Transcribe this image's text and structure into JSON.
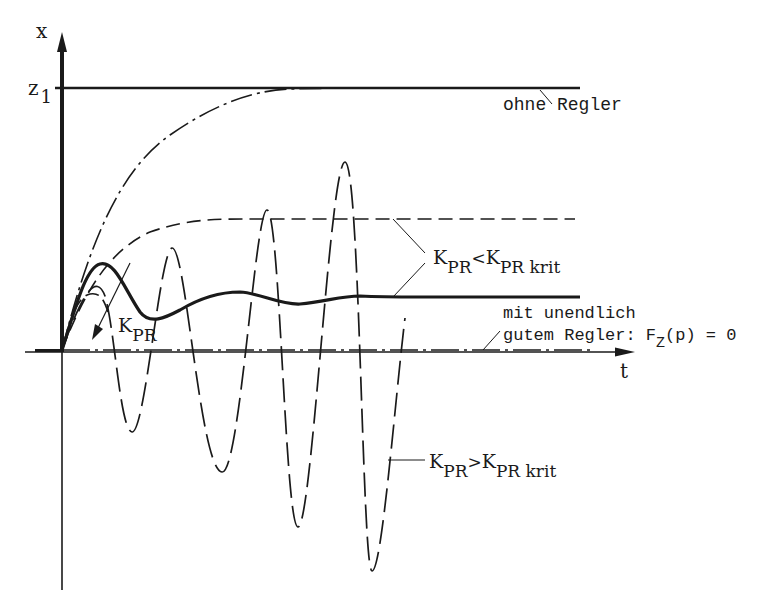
{
  "diagram": {
    "type": "step-response-comparison",
    "axes": {
      "y_label": "x",
      "x_label": "t",
      "y_tick_label_main": "z",
      "y_tick_label_sub": "1"
    },
    "labels": {
      "ohne_regler": "ohne Regler",
      "kpr_less": {
        "k1": "K",
        "k1_sub": "PR",
        "op": "<",
        "k2": "K",
        "k2_sub": "PR krit"
      },
      "kpr_greater": {
        "k1": "K",
        "k1_sub": "PR",
        "op": ">",
        "k2": "K",
        "k2_sub": "PR krit"
      },
      "kpr_arrow": {
        "k": "K",
        "k_sub": "PR"
      },
      "ideal_line1": "mit unendlich",
      "ideal_line2_prefix": "gutem Regler: F",
      "ideal_line2_sub": "Z",
      "ideal_line2_suffix": "(p) = 0"
    },
    "curves": [
      {
        "name": "ohne Regler",
        "style": "dash-dot",
        "behavior": "first-order rise to z1"
      },
      {
        "name": "K_PR < K_PR krit (weak)",
        "style": "dashed",
        "behavior": "rise to intermediate level"
      },
      {
        "name": "K_PR < K_PR krit (stronger)",
        "style": "solid-thick",
        "behavior": "damped oscillation settling lower"
      },
      {
        "name": "K_PR > K_PR krit",
        "style": "long-dashed",
        "behavior": "growing oscillation (unstable)"
      },
      {
        "name": "mit unendlich gutem Regler",
        "style": "dash-dot on t-axis",
        "behavior": "x = 0"
      }
    ],
    "colors": {
      "ink": "#1a1a1a",
      "background": "#ffffff"
    }
  }
}
